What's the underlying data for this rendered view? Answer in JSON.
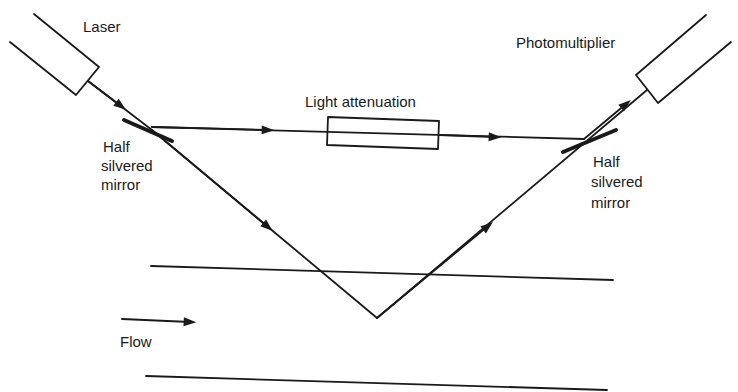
{
  "diagram": {
    "type": "laser doppler anemometer optical setup",
    "labels": {
      "laser": "Laser",
      "photomultiplier": "Photomultiplier",
      "light_attenuation": "Light attenuation",
      "left_mirror": [
        "Half",
        "silvered",
        "mirror"
      ],
      "right_mirror": [
        "Half",
        "silvered",
        "mirror"
      ],
      "flow": "Flow"
    },
    "colors": {
      "line": "#1a1a1a",
      "background": "#ffffff"
    }
  }
}
